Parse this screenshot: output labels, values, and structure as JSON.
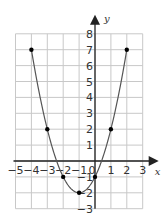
{
  "chart_data": {
    "type": "line",
    "title": "",
    "xlabel": "x",
    "ylabel": "y",
    "xlim": [
      -5,
      3
    ],
    "ylim": [
      -3,
      8
    ],
    "grid": true,
    "x_ticks": [
      "-5",
      "-4",
      "-3",
      "-2",
      "-1",
      "0",
      "1",
      "2",
      "3"
    ],
    "y_ticks": [
      "8",
      "7",
      "6",
      "5",
      "4",
      "3",
      "2",
      "1",
      "-1",
      "-2",
      "-3"
    ],
    "series": [
      {
        "name": "y = x^2 + 2x - 1",
        "points": [
          [
            -4,
            7
          ],
          [
            -3,
            2
          ],
          [
            -2,
            -1
          ],
          [
            -1,
            -2
          ],
          [
            0,
            -1
          ],
          [
            1,
            2
          ],
          [
            2,
            7
          ]
        ]
      }
    ],
    "colors": {
      "grid": "#c8c8c8",
      "axis": "#222222",
      "curve": "#555555",
      "point": "#000000"
    }
  },
  "labels": {
    "x_axis": "x",
    "y_axis": "y",
    "origin": "0"
  }
}
